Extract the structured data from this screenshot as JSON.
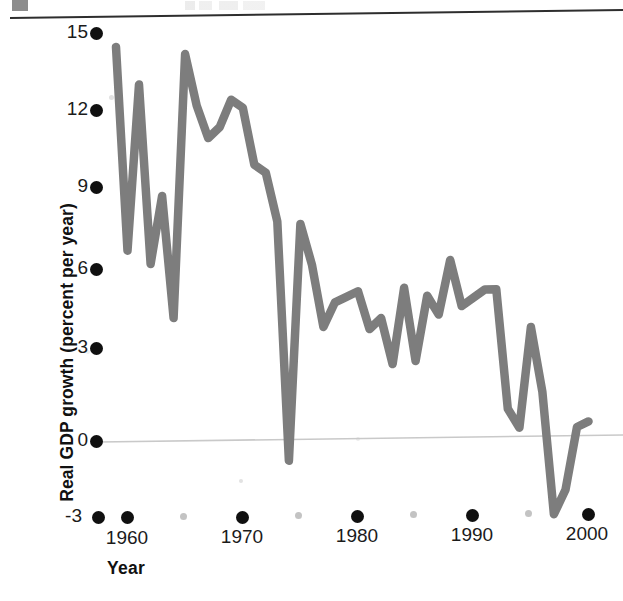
{
  "figure": {
    "background_color": "#ffffff",
    "line_color": "#7d7d7d",
    "tick_color": "#101010",
    "minor_tick_color": "#b9b9b9",
    "zero_line_color": "#c9c9c9"
  },
  "chart_data": {
    "type": "line",
    "title": "",
    "xlabel": "Year",
    "ylabel": "Real GDP growth (percent per year)",
    "xlim": [
      1959,
      2001
    ],
    "ylim": [
      -3,
      15
    ],
    "grid": false,
    "legend": "none",
    "zero_line": 0,
    "y_ticks": [
      15,
      12,
      9,
      6,
      3,
      0,
      -3
    ],
    "y_tick_labels": [
      "15",
      "12",
      "9",
      "6",
      "3",
      "0",
      "-3"
    ],
    "x_ticks": [
      1960,
      1970,
      1980,
      1990,
      2000
    ],
    "x_tick_labels": [
      "1960",
      "1970",
      "1980",
      "1990",
      "2000"
    ],
    "x_minor_ticks": [
      1965,
      1975,
      1985,
      1995
    ],
    "series": [
      {
        "name": "Real GDP growth",
        "x": [
          1959,
          1960,
          1961,
          1962,
          1963,
          1964,
          1965,
          1966,
          1967,
          1968,
          1969,
          1970,
          1971,
          1972,
          1973,
          1974,
          1975,
          1976,
          1977,
          1978,
          1979,
          1980,
          1981,
          1982,
          1983,
          1984,
          1985,
          1986,
          1987,
          1988,
          1989,
          1990,
          1991,
          1992,
          1993,
          1994,
          1995,
          1996,
          1997,
          1998,
          1999,
          2000
        ],
        "values": [
          14.5,
          7.0,
          13.1,
          6.5,
          9.0,
          4.5,
          14.2,
          12.3,
          11.1,
          11.5,
          12.5,
          12.2,
          10.1,
          9.8,
          8.0,
          -0.8,
          7.9,
          6.4,
          4.1,
          5.0,
          5.2,
          5.4,
          4.0,
          4.4,
          2.7,
          5.5,
          2.8,
          5.2,
          4.5,
          6.5,
          4.8,
          5.1,
          5.4,
          5.4,
          1.0,
          0.3,
          4.0,
          1.6,
          -2.9,
          -2.0,
          0.3,
          0.5
        ]
      }
    ]
  },
  "axis_labels": {
    "y": "Real GDP growth (percent per year)",
    "x": "Year"
  }
}
